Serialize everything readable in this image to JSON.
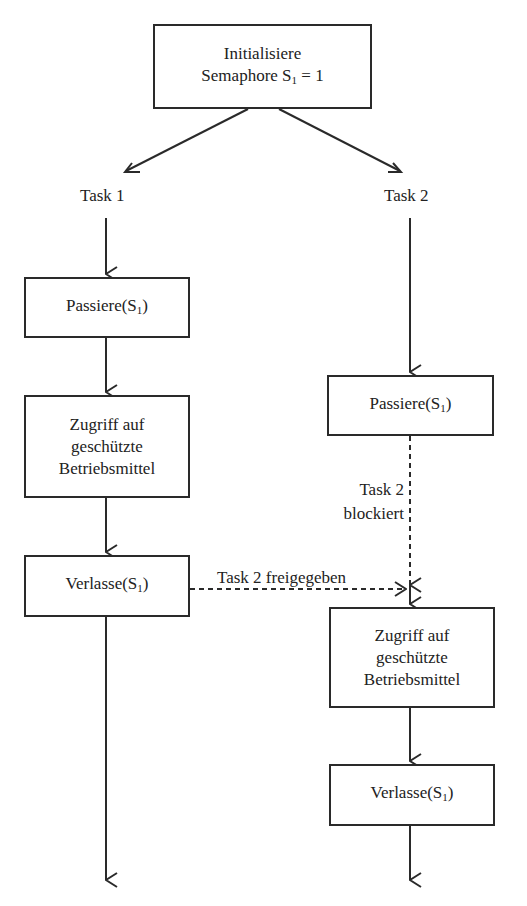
{
  "diagram": {
    "type": "flowchart",
    "top_box": {
      "line1": "Initialisiere",
      "line2_prefix": "Semaphore S",
      "line2_sub": "1",
      "line2_suffix": " = 1"
    },
    "tasks": [
      {
        "label": "Task 1",
        "steps": [
          {
            "prefix": "Passiere(S",
            "sub": "1",
            "suffix": ")"
          },
          {
            "lines": [
              "Zugriff auf",
              "geschützte",
              "Betriebsmittel"
            ]
          },
          {
            "prefix": "Verlasse(S",
            "sub": "1",
            "suffix": ")"
          }
        ]
      },
      {
        "label": "Task 2",
        "steps": [
          {
            "prefix": "Passiere(S",
            "sub": "1",
            "suffix": ")"
          },
          {
            "lines": [
              "Zugriff auf",
              "geschützte",
              "Betriebsmittel"
            ]
          },
          {
            "prefix": "Verlasse(S",
            "sub": "1",
            "suffix": ")"
          }
        ]
      }
    ],
    "annotations": {
      "blocked_line1": "Task 2",
      "blocked_line2": "blockiert",
      "released": "Task 2 freigegeben"
    },
    "colors": {
      "stroke": "#2a2a2a",
      "background": "#ffffff"
    }
  }
}
